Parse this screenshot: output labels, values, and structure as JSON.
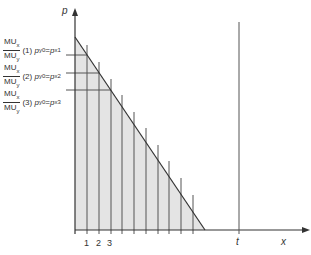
{
  "diagram": {
    "axes": {
      "y_label": "p",
      "x_label": "x"
    },
    "x_ticks": [
      "1",
      "2",
      "3"
    ],
    "t_label": "t",
    "price_labels": [
      {
        "numerator": "MU",
        "num_sub": "x",
        "denominator": "MU",
        "den_sub": "y",
        "index": "(1)",
        "lhs": "p",
        "lhs_sub": "y",
        "lhs_sup": "0",
        "eq": "=",
        "rhs": "p",
        "rhs_sub": "x",
        "rhs_sup": "1"
      },
      {
        "numerator": "MU",
        "num_sub": "x",
        "denominator": "MU",
        "den_sub": "y",
        "index": "(2)",
        "lhs": "p",
        "lhs_sub": "y",
        "lhs_sup": "0",
        "eq": "=",
        "rhs": "p",
        "rhs_sub": "x",
        "rhs_sup": "2"
      },
      {
        "numerator": "MU",
        "num_sub": "x",
        "denominator": "MU",
        "den_sub": "y",
        "index": "(3)",
        "lhs": "p",
        "lhs_sub": "y",
        "lhs_sup": "0",
        "eq": "=",
        "rhs": "p",
        "rhs_sub": "x",
        "rhs_sup": "3"
      }
    ],
    "colors": {
      "shade": "#e4e4e4",
      "line": "#333333",
      "grid": "#555555"
    }
  }
}
